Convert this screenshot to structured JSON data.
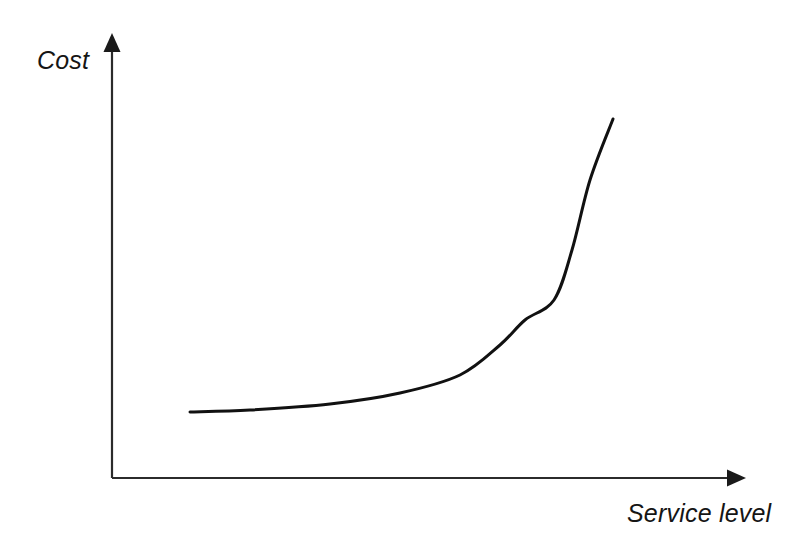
{
  "figure": {
    "background_color": "#ffffff",
    "width": 786,
    "height": 547
  },
  "axes": {
    "y_axis": {
      "label": "Cost",
      "name": "y-axis",
      "color": "#2b2b2b",
      "arrow": "arrow-up",
      "origin": [
        112,
        478
      ],
      "tip": [
        112,
        34
      ]
    },
    "x_axis": {
      "label": "Service level",
      "name": "x-axis",
      "color": "#2b2b2b",
      "arrow": "arrow-right",
      "origin": [
        112,
        478
      ],
      "tip": [
        745,
        478
      ]
    }
  },
  "chart_data": {
    "type": "line",
    "title": "",
    "subtitle": "",
    "xlabel": "Service level",
    "ylabel": "Cost",
    "grid": false,
    "legend": false,
    "legend_position": "none",
    "axis_ticks": false,
    "tick_labels": {
      "x": [],
      "y": []
    },
    "xlim": [
      0,
      1
    ],
    "ylim": [
      0,
      1
    ],
    "annotations": [],
    "series": [
      {
        "name": "Cost curve",
        "color": "#111111",
        "line_width": 3,
        "shape": "exponential-increasing",
        "description": "Cost rises slowly at low service levels then increases sharply as service level approaches its maximum",
        "x": [
          0.123,
          0.218,
          0.345,
          0.455,
          0.55,
          0.613,
          0.653,
          0.699,
          0.727,
          0.755,
          0.791
        ],
        "y": [
          0.149,
          0.153,
          0.167,
          0.192,
          0.232,
          0.3,
          0.357,
          0.401,
          0.514,
          0.671,
          0.809
        ],
        "points_px": [
          [
            190,
            412
          ],
          [
            250,
            410
          ],
          [
            330,
            404
          ],
          [
            400,
            393
          ],
          [
            460,
            375
          ],
          [
            500,
            345
          ],
          [
            525,
            320
          ],
          [
            554,
            300
          ],
          [
            572,
            250
          ],
          [
            590,
            180
          ],
          [
            613,
            119
          ]
        ]
      }
    ]
  }
}
